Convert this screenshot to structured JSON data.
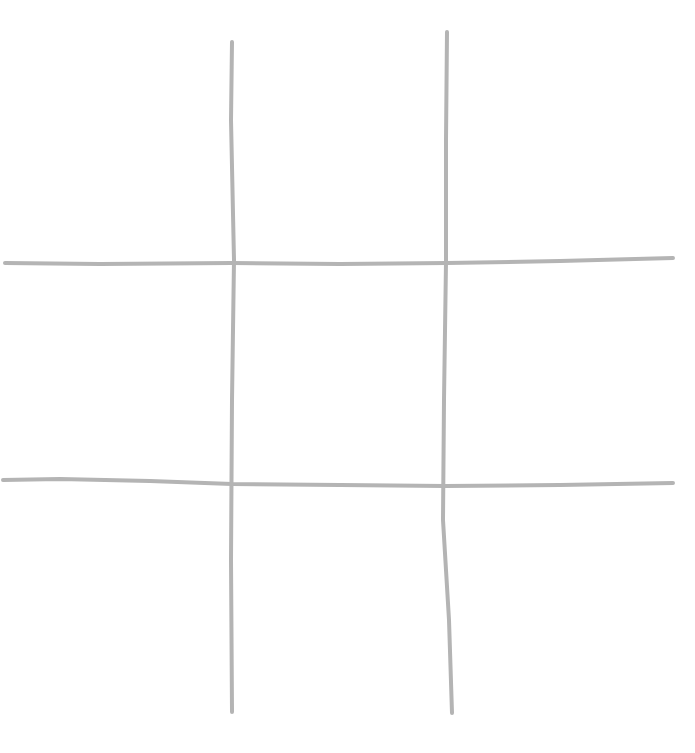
{
  "game": {
    "type": "tic-tac-toe",
    "line_color": "#b4b4b4",
    "line_width": 4,
    "grid_lines": {
      "vertical": [
        {
          "points": [
            [
              232,
              42
            ],
            [
              231,
              120
            ],
            [
              234,
              260
            ],
            [
              232,
              400
            ],
            [
              231,
              560
            ],
            [
              232,
              712
            ]
          ]
        },
        {
          "points": [
            [
              447,
              32
            ],
            [
              446,
              140
            ],
            [
              446,
              262
            ],
            [
              444,
              400
            ],
            [
              443,
              520
            ],
            [
              449,
              620
            ],
            [
              452,
              713
            ]
          ]
        }
      ],
      "horizontal": [
        {
          "points": [
            [
              5,
              263
            ],
            [
              100,
              264
            ],
            [
              232,
              263
            ],
            [
              340,
              264
            ],
            [
              447,
              263
            ],
            [
              560,
              261
            ],
            [
              673,
              258
            ]
          ]
        },
        {
          "points": [
            [
              3,
              480
            ],
            [
              60,
              479
            ],
            [
              150,
              481
            ],
            [
              232,
              484
            ],
            [
              340,
              485
            ],
            [
              445,
              486
            ],
            [
              560,
              485
            ],
            [
              673,
              483
            ]
          ]
        }
      ]
    },
    "cells": [
      {
        "row": 0,
        "col": 0,
        "mark": ""
      },
      {
        "row": 0,
        "col": 1,
        "mark": ""
      },
      {
        "row": 0,
        "col": 2,
        "mark": ""
      },
      {
        "row": 1,
        "col": 0,
        "mark": ""
      },
      {
        "row": 1,
        "col": 1,
        "mark": ""
      },
      {
        "row": 1,
        "col": 2,
        "mark": ""
      },
      {
        "row": 2,
        "col": 0,
        "mark": ""
      },
      {
        "row": 2,
        "col": 1,
        "mark": ""
      },
      {
        "row": 2,
        "col": 2,
        "mark": ""
      }
    ]
  }
}
